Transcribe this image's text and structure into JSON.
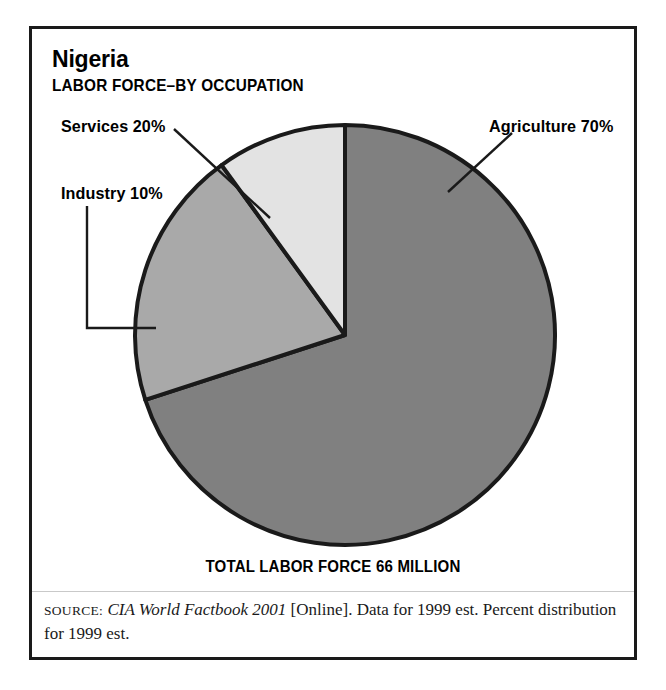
{
  "figure": {
    "country": "Nigeria",
    "subtitle": "LABOR FORCE–BY OCCUPATION",
    "total_caption": "TOTAL LABOR FORCE 66 MILLION",
    "source": {
      "label": "SOURCE:",
      "publication": "CIA World Factbook 2001",
      "detail": " [Online]. Data for 1999 est. Percent distribution for 1999 est."
    },
    "labels": {
      "services": "Services 20%",
      "industry": "Industry 10%",
      "agriculture": "Agriculture 70%"
    },
    "colors": {
      "agriculture": "#808080",
      "services": "#a9a9a9",
      "industry": "#e3e3e3",
      "outline": "#1a1a1a",
      "frame": "#1a1a1a",
      "background": "#ffffff"
    }
  },
  "chart_data": {
    "type": "pie",
    "title": "Nigeria",
    "subtitle": "LABOR FORCE–BY OCCUPATION",
    "categories": [
      "Agriculture",
      "Services",
      "Industry"
    ],
    "values": [
      70,
      20,
      10
    ],
    "unit": "percent",
    "total_label": "TOTAL LABOR FORCE 66 MILLION",
    "total_value": 66,
    "total_unit": "million",
    "slice_colors": [
      "#808080",
      "#a9a9a9",
      "#e3e3e3"
    ],
    "labels": [
      "Agriculture 70%",
      "Services 20%",
      "Industry 10%"
    ],
    "start_angle_deg": 0,
    "direction": "clockwise",
    "legend": "callout-labels",
    "grid": false,
    "annotations": [
      "SOURCE: CIA World Factbook 2001 [Online]. Data for 1999 est. Percent distribution for 1999 est."
    ]
  }
}
